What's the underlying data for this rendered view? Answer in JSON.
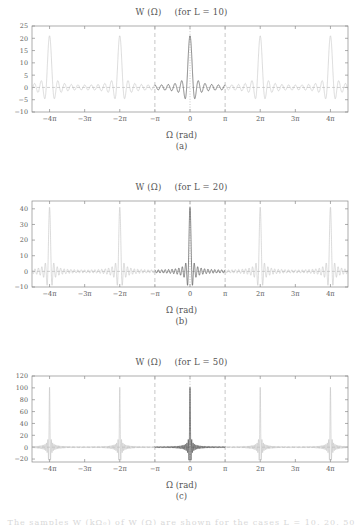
{
  "figure": {
    "bottom_partial_text": "The  samples  W (kΩ₀) of W (Ω) are shown for the cases L = 10, 20, 50",
    "axis_label": "Ω (rad)",
    "xticks": [
      "−4π",
      "−3π",
      "−2π",
      "−π",
      "0",
      "π",
      "2π",
      "3π",
      "4π"
    ],
    "colors": {
      "curve_main": "#3a3a3a",
      "curve_replica": "#bdbdbd",
      "axis": "#8a8a8a",
      "guide": "#b0b0b0",
      "text": "#555555"
    }
  },
  "panels": [
    {
      "caption": "(a)",
      "title_fn": "W (Ω)",
      "title_cond": "(for L = 10)",
      "L": 10,
      "yticks": [
        "25",
        "20",
        "15",
        "10",
        "5",
        "0",
        "−5",
        "−10"
      ],
      "ylim": [
        -10,
        25
      ],
      "peak": 21
    },
    {
      "caption": "(b)",
      "title_fn": "W (Ω)",
      "title_cond": "(for L = 20)",
      "L": 20,
      "yticks": [
        "40",
        "30",
        "20",
        "10",
        "0",
        "−10"
      ],
      "ylim": [
        -10,
        45
      ],
      "peak": 41
    },
    {
      "caption": "(c)",
      "title_fn": "W (Ω)",
      "title_cond": "(for L = 50)",
      "L": 50,
      "yticks": [
        "120",
        "100",
        "80",
        "60",
        "40",
        "20",
        "0",
        "−20"
      ],
      "ylim": [
        -25,
        120
      ],
      "peak": 101
    }
  ],
  "chart_data": {
    "type": "line",
    "xlabel": "Ω (rad)",
    "ylabel": "W (Ω)",
    "formula": "W(Ω) = sin((2L+1)Ω/2) / sin(Ω/2)",
    "xlim": [
      -14.137,
      14.137
    ],
    "xlim_in_pi": [
      -4.5,
      4.5
    ],
    "grid": false,
    "legend": false,
    "guides": {
      "dashed_vertical_at": [
        "−π",
        "π"
      ],
      "dotted_vertical_at": [
        "0"
      ],
      "dashed_horizontal_at": [
        "0"
      ]
    },
    "series": [
      {
        "name": "L = 10",
        "panel": "(a)",
        "peak_value": 21,
        "peak_locations_in_pi": [
          -4,
          -2,
          0,
          2,
          4
        ],
        "mainlobe_halfwidth_in_pi": 0.0952,
        "ylim": [
          -10,
          25
        ],
        "yticks": [
          25,
          20,
          15,
          10,
          5,
          0,
          -5,
          -10
        ],
        "min_sidelobe_approx": -4.6
      },
      {
        "name": "L = 20",
        "panel": "(b)",
        "peak_value": 41,
        "peak_locations_in_pi": [
          -4,
          -2,
          0,
          2,
          4
        ],
        "mainlobe_halfwidth_in_pi": 0.0488,
        "ylim": [
          -10,
          45
        ],
        "yticks": [
          40,
          30,
          20,
          10,
          0,
          -10
        ],
        "min_sidelobe_approx": -9.0
      },
      {
        "name": "L = 50",
        "panel": "(c)",
        "peak_value": 101,
        "peak_locations_in_pi": [
          -4,
          -2,
          0,
          2,
          4
        ],
        "mainlobe_halfwidth_in_pi": 0.0198,
        "ylim": [
          -25,
          120
        ],
        "yticks": [
          120,
          100,
          80,
          60,
          40,
          20,
          0,
          -20
        ],
        "min_sidelobe_approx": -22.0
      }
    ]
  }
}
